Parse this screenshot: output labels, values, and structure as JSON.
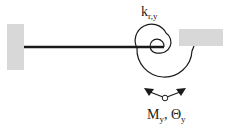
{
  "diagram": {
    "spring_label": {
      "main": "k",
      "sub": "r,y"
    },
    "moment_label": {
      "m_main": "M",
      "m_sub": "y",
      "sep": ", ",
      "theta_main": "Θ",
      "theta_sub": "y"
    },
    "colors": {
      "support": "#d8d8d8",
      "line": "#1a1a1a",
      "background": "#ffffff"
    },
    "elements": [
      "left-fixed-support",
      "beam",
      "rotational-spring",
      "right-fixed-support",
      "moment-rotation-arrows"
    ]
  }
}
